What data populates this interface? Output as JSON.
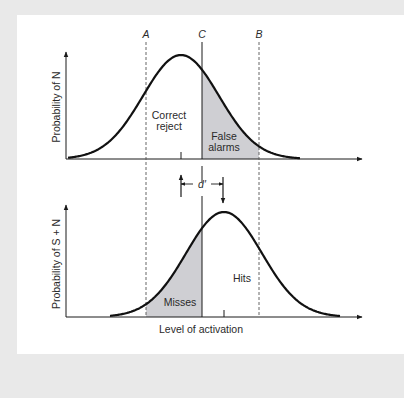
{
  "figure": {
    "type": "signal-detection-diagram",
    "cutoffs": {
      "a": {
        "label": "A",
        "x": 146,
        "style": "dashed"
      },
      "c": {
        "label": "C",
        "x": 202,
        "style": "solid"
      },
      "b": {
        "label": "B",
        "x": 259,
        "style": "dashed"
      }
    },
    "top_panel": {
      "ylabel": "Probability of N",
      "regions": {
        "correct_reject_line1": "Correct",
        "correct_reject_line2": "reject",
        "false_alarms_line1": "False",
        "false_alarms_line2": "alarms"
      },
      "curve": {
        "mean_x": 181,
        "baseline_y": 159,
        "peak_y": 55,
        "sigma": 38
      }
    },
    "separation": {
      "label": "d′"
    },
    "bottom_panel": {
      "ylabel": "Probability of S + N",
      "xlabel": "Level of activation",
      "regions": {
        "misses": "Misses",
        "hits": "Hits"
      },
      "curve": {
        "mean_x": 224,
        "baseline_y": 317,
        "peak_y": 212,
        "sigma": 38
      }
    },
    "colors": {
      "background": "#e9e9e9",
      "panel": "#ffffff",
      "ink": "#1a1a1a",
      "shade": "#cfcfd3"
    }
  }
}
